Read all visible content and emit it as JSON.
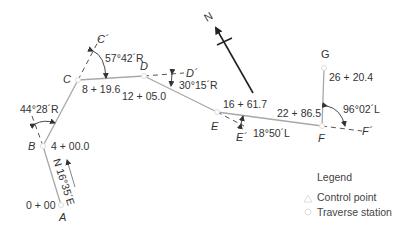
{
  "diagram": {
    "colors": {
      "traverse_line": "#a8a8a8",
      "dashed_line": "#555555",
      "north_arrow": "#222222",
      "text": "#333333",
      "station_marker": "#dddddd"
    },
    "points": {
      "A": {
        "label": "A",
        "station": "0 + 00"
      },
      "B": {
        "label": "B",
        "station": "4 + 00.0"
      },
      "C": {
        "label": "C",
        "station": "8 + 19.6"
      },
      "D": {
        "label": "D",
        "station": "12 + 05.0"
      },
      "E": {
        "label": "E",
        "station": "16 + 61.7"
      },
      "F": {
        "label": "F",
        "station": "22 + 86.5"
      },
      "G": {
        "label": "G",
        "station": "26 + 20.4"
      }
    },
    "extension_points": {
      "C_prime": "C´",
      "D_prime": "D´",
      "E_prime": "E´",
      "F_prime": "F´"
    },
    "bearing": "N 16°35´E",
    "deflection_angles": {
      "B": "44°28´R",
      "C": "57°42´R",
      "D": "30°15´R",
      "E": "18°50´L",
      "F": "96°02´L"
    },
    "north_arrow_label": "N"
  },
  "legend": {
    "title": "Legend",
    "items": [
      {
        "icon": "triangle-icon",
        "label": "Control point"
      },
      {
        "icon": "circle-icon",
        "label": "Traverse station"
      }
    ]
  }
}
